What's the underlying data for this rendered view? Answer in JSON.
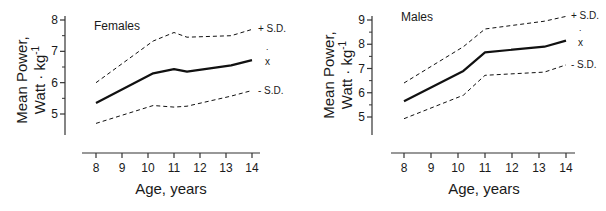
{
  "chart_data": [
    {
      "type": "line",
      "title": "Females",
      "xlabel": "Age, years",
      "ylabel_line1": "Mean Power,",
      "ylabel_line2": "Watt · kg",
      "ylabel_sup": "-1",
      "xlim": [
        8,
        14
      ],
      "ylim": [
        4.3,
        8
      ],
      "x_ticks": [
        8,
        9,
        10,
        11,
        12,
        13,
        14
      ],
      "y_ticks": [
        5,
        6,
        7,
        8
      ],
      "grid": false,
      "legend_position": "right-inline",
      "series": [
        {
          "name": "+ S.D.",
          "style": "dashed",
          "x": [
            8,
            10.2,
            11,
            11.5,
            13.2,
            14
          ],
          "values": [
            6.0,
            7.33,
            7.6,
            7.45,
            7.5,
            7.7
          ]
        },
        {
          "name": "x̄",
          "style": "solid-bold",
          "x": [
            8,
            10.2,
            11,
            11.5,
            13.2,
            14
          ],
          "values": [
            5.35,
            6.3,
            6.43,
            6.35,
            6.55,
            6.72
          ]
        },
        {
          "name": "- S.D.",
          "style": "dashed",
          "x": [
            8,
            10.2,
            11,
            11.5,
            13.2,
            14
          ],
          "values": [
            4.7,
            5.27,
            5.22,
            5.25,
            5.57,
            5.75
          ]
        }
      ]
    },
    {
      "type": "line",
      "title": "Males",
      "xlabel": "Age, years",
      "ylabel_line1": "Mean Power,",
      "ylabel_line2": "Watt · kg",
      "ylabel_sup": "-1",
      "xlim": [
        8,
        14
      ],
      "ylim": [
        4.3,
        9
      ],
      "x_ticks": [
        8,
        9,
        10,
        11,
        12,
        13,
        14
      ],
      "y_ticks": [
        5,
        6,
        7,
        8,
        9
      ],
      "grid": false,
      "legend_position": "right-inline",
      "series": [
        {
          "name": "+ S.D.",
          "style": "dashed",
          "x": [
            8,
            10.2,
            11,
            13.2,
            14
          ],
          "values": [
            6.4,
            7.9,
            8.63,
            8.95,
            9.15
          ]
        },
        {
          "name": "x̄",
          "style": "solid-bold",
          "x": [
            8,
            10.2,
            11,
            13.2,
            14
          ],
          "values": [
            5.65,
            6.9,
            7.67,
            7.9,
            8.15
          ]
        },
        {
          "name": "- S.D.",
          "style": "dashed",
          "x": [
            8,
            10.2,
            11,
            13.2,
            14
          ],
          "values": [
            4.93,
            5.9,
            6.72,
            6.85,
            7.15
          ]
        }
      ]
    }
  ]
}
